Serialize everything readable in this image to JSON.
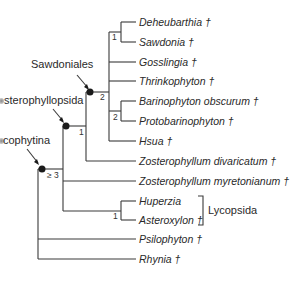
{
  "diagram": {
    "type": "cladogram",
    "colors": {
      "line": "#3a3a3a",
      "text": "#2a2a2a",
      "node": "#1a1a1a"
    },
    "taxa": [
      {
        "name": "Deheubarthia",
        "extinct_mark": "†"
      },
      {
        "name": "Sawdonia",
        "extinct_mark": "†"
      },
      {
        "name": "Gosslingia",
        "extinct_mark": "†"
      },
      {
        "name": "Thrinkophyton",
        "extinct_mark": "†"
      },
      {
        "name": "Barinophyton obscurum",
        "extinct_mark": "†"
      },
      {
        "name": "Protobarinophyton",
        "extinct_mark": "†"
      },
      {
        "name": "Hsua",
        "extinct_mark": "†"
      },
      {
        "name": "Zosterophyllum divaricatum",
        "extinct_mark": "†"
      },
      {
        "name": "Zosterophyllum myretonianum",
        "extinct_mark": "†"
      },
      {
        "name": "Huperzia",
        "extinct_mark": ""
      },
      {
        "name": "Asteroxylon",
        "extinct_mark": "†"
      },
      {
        "name": "Psilophyton",
        "extinct_mark": "†"
      },
      {
        "name": "Rhynia",
        "extinct_mark": "†"
      }
    ],
    "taxa_display": [
      "Deheubarthia †",
      "Sawdonia †",
      "Gosslingia †",
      "Thrinkophyton †",
      "Barinophyton obscurum †",
      "Protobarinophyton †",
      "Hsua †",
      "Zosterophyllum divaricatum †",
      "Zosterophyllum myretonianum †",
      "Huperzia",
      "Asteroxylon †",
      "Psilophyton †",
      "Rhynia †"
    ],
    "clades": {
      "sawdoniales": "Sawdoniales",
      "sterophyllopsida": "sterophyllopsida",
      "cophytina": "cophytina",
      "lycopsida": "Lycopsida"
    },
    "support_values": {
      "deheubarthia_sawdonia": "1",
      "sawdoniales": "2",
      "barinophyton_protobarinophyton": "2",
      "sterophyllopsida": "1",
      "cophytina": "≥ 3",
      "lycopsida": "1"
    }
  }
}
